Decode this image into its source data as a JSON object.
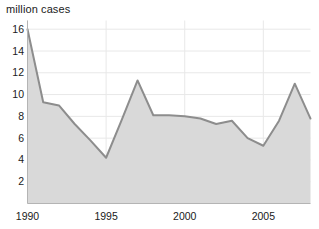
{
  "chart_data": {
    "type": "area",
    "title": "million cases",
    "xlabel": "",
    "ylabel": "million cases",
    "ylim": [
      0,
      16.8
    ],
    "xlim": [
      1990,
      2008
    ],
    "grid": true,
    "legend": "none",
    "line_color": "#8d8d8d",
    "fill_color": "#d9d9d9",
    "grid_color": "#e8e8e8",
    "axis_color": "#b4b4b4",
    "text_color": "#1a1a1a",
    "x": [
      1990,
      1991,
      1992,
      1993,
      1994,
      1995,
      1996,
      1997,
      1998,
      1999,
      2000,
      2001,
      2002,
      2003,
      2004,
      2005,
      2006,
      2007,
      2008
    ],
    "values": [
      16.0,
      9.3,
      9.0,
      7.3,
      5.8,
      4.2,
      7.7,
      11.3,
      8.1,
      8.1,
      8.0,
      7.8,
      7.3,
      7.6,
      6.0,
      5.3,
      7.6,
      11.0,
      7.8
    ],
    "ytick_values": [
      16,
      14,
      12,
      10,
      8,
      6,
      4,
      2
    ],
    "ytick_labels": [
      "16",
      "14",
      "12",
      "10",
      "8",
      "6",
      "4",
      "2"
    ],
    "xtick_values": [
      1990,
      1995,
      2000,
      2005
    ],
    "xtick_labels": [
      "1990",
      "1995",
      "2000",
      "2005"
    ]
  }
}
